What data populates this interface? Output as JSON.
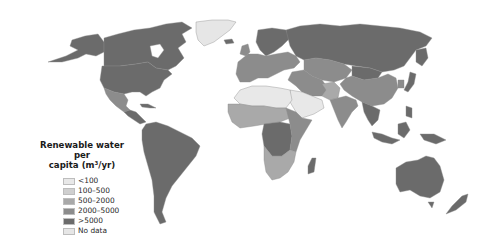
{
  "map": {
    "type": "choropleth",
    "projection": "world (Robinson-like)",
    "colors": {
      "lt100": "#e8e8e8",
      "100_500": "#cfcfcf",
      "500_2000": "#a9a9a9",
      "2000_5000": "#8c8c8c",
      "gt5000": "#6b6b6b",
      "no_data": "#e6e6e6",
      "ocean": "#ffffff"
    }
  },
  "legend": {
    "title_line1": "Renewable water per",
    "title_line2": "capita (m³/yr)",
    "items": [
      {
        "label": "<100",
        "color": "#e8e8e8"
      },
      {
        "label": "100–500",
        "color": "#cfcfcf"
      },
      {
        "label": "500–2000",
        "color": "#a9a9a9"
      },
      {
        "label": "2000–5000",
        "color": "#8c8c8c"
      },
      {
        "label": ">5000",
        "color": "#6b6b6b"
      },
      {
        "label": "No data",
        "color": "#e6e6e6"
      }
    ]
  },
  "regions": [
    {
      "name": "North America (Canada, USA)",
      "class": ">5000"
    },
    {
      "name": "Alaska",
      "class": ">5000"
    },
    {
      "name": "Greenland",
      "class": "No data"
    },
    {
      "name": "Mexico",
      "class": "2000–5000"
    },
    {
      "name": "Central America & Caribbean",
      "class": ">5000"
    },
    {
      "name": "South America",
      "class": ">5000"
    },
    {
      "name": "Northern Europe / Scandinavia",
      "class": ">5000"
    },
    {
      "name": "Western & Central Europe",
      "class": "2000–5000"
    },
    {
      "name": "Russia",
      "class": ">5000"
    },
    {
      "name": "Central Asia",
      "class": "2000–5000"
    },
    {
      "name": "North Africa (Sahara)",
      "class": "<100"
    },
    {
      "name": "Arabian Peninsula",
      "class": "<100"
    },
    {
      "name": "Sahel / West Africa",
      "class": "500–2000"
    },
    {
      "name": "Central Africa (Congo basin)",
      "class": ">5000"
    },
    {
      "name": "East Africa",
      "class": "2000–5000"
    },
    {
      "name": "Southern Africa",
      "class": "500–2000"
    },
    {
      "name": "Madagascar",
      "class": ">5000"
    },
    {
      "name": "Middle East (Iran, Iraq)",
      "class": "2000–5000"
    },
    {
      "name": "Pakistan",
      "class": "500–2000"
    },
    {
      "name": "India",
      "class": "2000–5000"
    },
    {
      "name": "China",
      "class": "2000–5000"
    },
    {
      "name": "Mongolia",
      "class": ">5000"
    },
    {
      "name": "Southeast Asia",
      "class": ">5000"
    },
    {
      "name": "Japan",
      "class": ">5000"
    },
    {
      "name": "Indonesia / New Guinea",
      "class": ">5000"
    },
    {
      "name": "Australia",
      "class": ">5000"
    },
    {
      "name": "New Zealand",
      "class": ">5000"
    }
  ]
}
